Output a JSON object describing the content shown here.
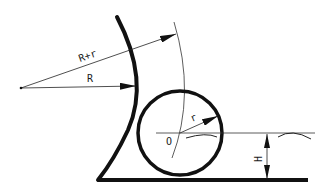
{
  "diagram": {
    "type": "geometric-construction",
    "labels": {
      "outer_radius": "R+r",
      "inner_radius": "R",
      "small_radius": "r",
      "center": "O",
      "height": "H"
    },
    "colors": {
      "stroke": "#111111",
      "thin_stroke": "#333333",
      "background": "#ffffff"
    }
  }
}
